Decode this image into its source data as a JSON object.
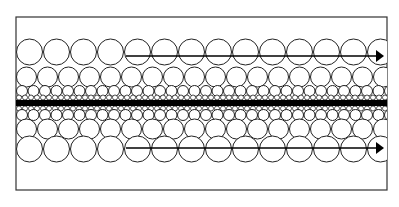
{
  "diagram": {
    "type": "particle-layer-flow",
    "colors": {
      "background": "#ffffff",
      "stroke": "#222222",
      "frame": "#333333",
      "center_bar": "#000000"
    },
    "frame": {
      "x": 16,
      "y": 17,
      "width": 371,
      "height": 173
    },
    "center_bar": {
      "y": 100,
      "height": 6
    },
    "rows": [
      {
        "name": "top-row-large",
        "cy": 52,
        "r": 13,
        "spacing": 27
      },
      {
        "name": "top-row-medium",
        "cy": 77,
        "r": 10,
        "spacing": 21
      },
      {
        "name": "top-row-small",
        "cy": 91,
        "r": 5.5,
        "spacing": 11.5
      },
      {
        "name": "top-row-tiny",
        "cy": 97.5,
        "r": 2.5,
        "spacing": 6
      },
      {
        "name": "bottom-row-tiny",
        "cy": 108.5,
        "r": 2.5,
        "spacing": 6
      },
      {
        "name": "bottom-row-small",
        "cy": 115,
        "r": 5.5,
        "spacing": 11.5
      },
      {
        "name": "bottom-row-medium",
        "cy": 129,
        "r": 10,
        "spacing": 21
      },
      {
        "name": "bottom-row-large",
        "cy": 149,
        "r": 13,
        "spacing": 27
      }
    ],
    "arrows": [
      {
        "name": "top-arrow",
        "x1": 126,
        "x2": 384,
        "y": 56
      },
      {
        "name": "bottom-arrow",
        "x1": 126,
        "x2": 384,
        "y": 148
      }
    ]
  }
}
